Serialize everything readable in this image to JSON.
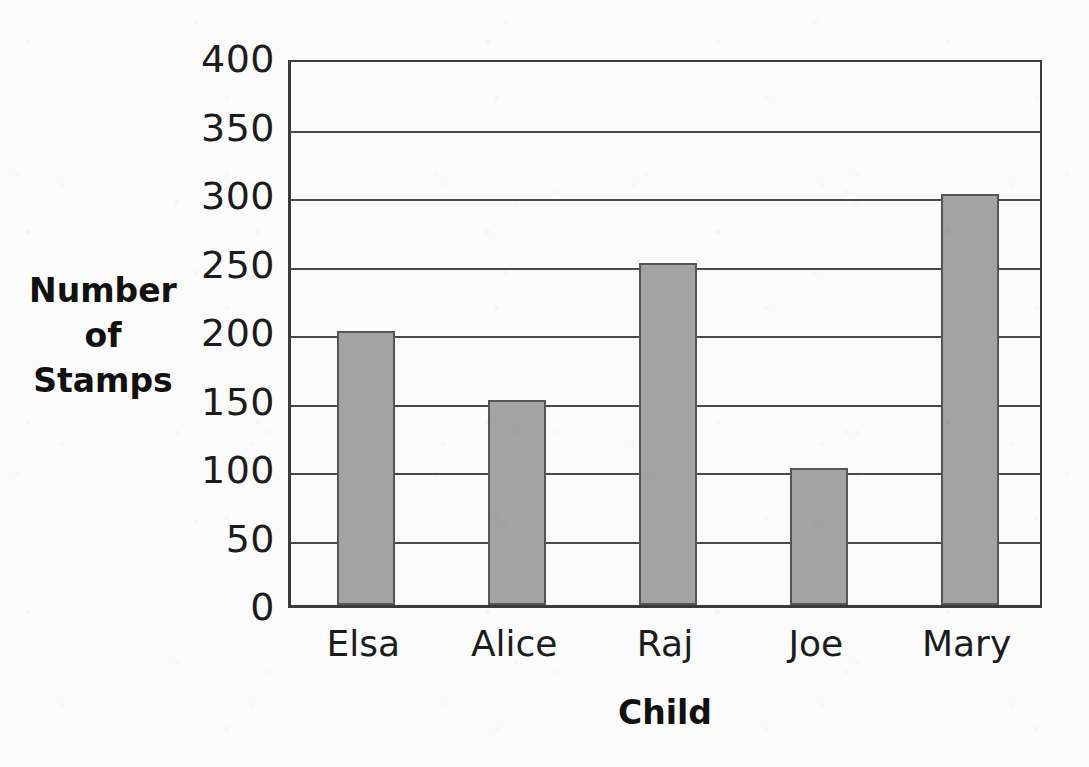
{
  "chart_data": {
    "type": "bar",
    "title": "",
    "categories": [
      "Elsa",
      "Alice",
      "Raj",
      "Joe",
      "Mary"
    ],
    "values": [
      200,
      150,
      250,
      100,
      300
    ],
    "xlabel": "Child",
    "ylabel": "Number of Stamps",
    "ylabel_lines": [
      "Number",
      "of",
      "Stamps"
    ],
    "ylim": [
      0,
      400
    ],
    "ytick_labels": [
      "400",
      "350",
      "300",
      "250",
      "200",
      "150",
      "100",
      "50",
      "0"
    ],
    "ytick_values": [
      400,
      350,
      300,
      250,
      200,
      150,
      100,
      50,
      0
    ],
    "ytick_step": 50,
    "grid": true,
    "grid_orientation": "horizontal",
    "legend": null,
    "legend_position": "none",
    "bar_color": "#a3a3a3",
    "bar_edge_color": "#555555",
    "axis_color": "#3a3a3a",
    "background_color": "#fbfbfb",
    "text_color": "#1c1c1c"
  }
}
